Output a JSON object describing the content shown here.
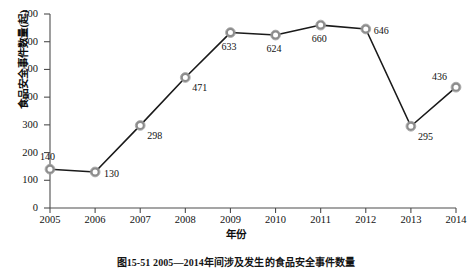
{
  "chart_data": {
    "type": "line",
    "title": "",
    "caption": "图15-51  2005—2014年间涉及发生的食品安全事件数量",
    "xlabel": "年份",
    "ylabel": "食品安全事件数量(起)",
    "categories": [
      "2005",
      "2006",
      "2007",
      "2008",
      "2009",
      "2010",
      "2011",
      "2012",
      "2013",
      "2014"
    ],
    "values": [
      140,
      130,
      298,
      471,
      633,
      624,
      660,
      646,
      295,
      436
    ],
    "point_labels": [
      "140",
      "130",
      "298",
      "471",
      "633",
      "624",
      "660",
      "646",
      "295",
      "436"
    ],
    "ylim": [
      0,
      700
    ],
    "yticks": [
      "0",
      "100",
      "200",
      "300",
      "400",
      "500",
      "600",
      "700"
    ],
    "xticks": [
      "2005",
      "2006",
      "2007",
      "2008",
      "2009",
      "2010",
      "2011",
      "2012",
      "2013",
      "2014"
    ],
    "grid": false,
    "legend": false,
    "series_color": "#1a1a1a",
    "marker": "open-circle",
    "marker_edge_color": "#8c8c8c",
    "axis_color": "#4d4d4d"
  }
}
